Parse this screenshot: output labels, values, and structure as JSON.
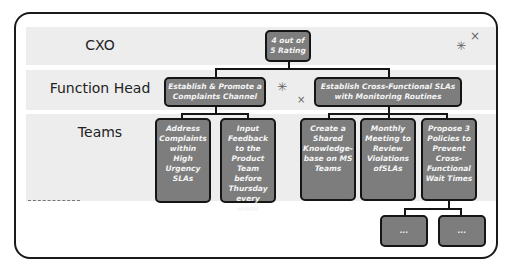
{
  "rows": {
    "cxo": "CXO",
    "function_head": "Function Head",
    "teams": "Teams"
  },
  "nodes": {
    "rating": "4 out of 5 Rating",
    "complaints_channel": "Establish & Promote a Complaints Channel",
    "cross_functional_slas": "Establish Cross-Functional SLAs with Monitoring Routines",
    "address_complaints": "Address Complaints within High Urgency SLAs",
    "input_feedback": "Input Feedback to the Product Team before Thursday every week",
    "knowledge_base": "Create a Shared Knowledge-base on MS Teams",
    "monthly_meeting": "Monthly Meeting to Review Violations ofSLAs",
    "propose_policies": "Propose 3 Policies to Prevent Cross-Functional Wait Times",
    "child_1": "...",
    "child_2": "..."
  },
  "decorations": {
    "sparkle": "✳",
    "cross": "×"
  }
}
